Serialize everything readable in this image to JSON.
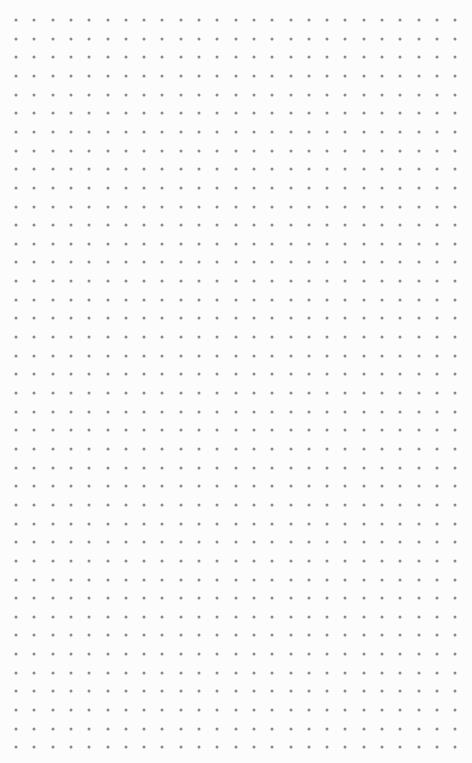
{
  "canvas": {
    "background": "#fcfcfc",
    "dot_color": "#8a8a8a",
    "dot_size": 3,
    "grid": {
      "origin_x": 16,
      "origin_y": 20,
      "spacing_x": 18.3,
      "spacing_y": 18.65,
      "columns": 26,
      "rows": 41
    }
  }
}
